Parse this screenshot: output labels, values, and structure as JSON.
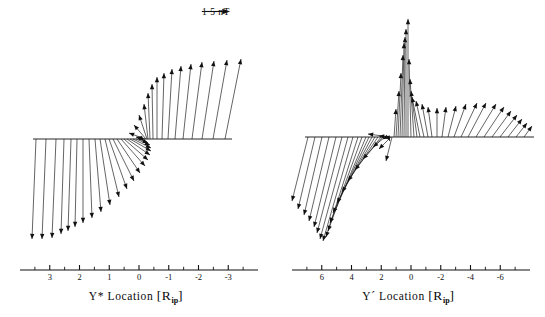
{
  "figure": {
    "background_color": "#ffffff",
    "line_color": "#111111",
    "panels": [
      {
        "id": "left",
        "axis_label_prefix": "Y*",
        "axis_label_main": " Location ",
        "axis_unit_open": "[R",
        "axis_unit_sub": "ip",
        "axis_unit_close": "]",
        "scalebar_label": "1 5 nT",
        "tick_labels": [
          "3",
          "2",
          "1",
          "0",
          "-1",
          "-2",
          "-3"
        ],
        "axis_min": 3,
        "axis_max": -3
      },
      {
        "id": "right",
        "axis_label_prefix": "Y´",
        "axis_label_main": " Location ",
        "axis_unit_open": "[R",
        "axis_unit_sub": "ip",
        "axis_unit_close": "]",
        "scalebar_label": "1 5 nT",
        "tick_labels": [
          "6",
          "4",
          "2",
          "0",
          "-2",
          "-4",
          "-6"
        ],
        "axis_min": 6,
        "axis_max": -6
      }
    ]
  },
  "chart_data": {
    "type": "scatter",
    "title": "",
    "grid": false,
    "legend_position": "top-right",
    "panels": [
      {
        "name": "left",
        "xlabel": "Y* Location [R_ip]",
        "ylabel": "",
        "xlim": [
          3,
          -3
        ],
        "scalebar_value": "1 5 nT",
        "scalebar_pixel_length": 26,
        "baseline_y": 139,
        "baseline_x_start": 33,
        "baseline_x_end": 232,
        "vectors": [
          {
            "x0": 36,
            "dx": -4,
            "dy": 100
          },
          {
            "x0": 46,
            "dx": -4,
            "dy": 100
          },
          {
            "x0": 56,
            "dx": -4,
            "dy": 99
          },
          {
            "x0": 64,
            "dx": -3,
            "dy": 95
          },
          {
            "x0": 71,
            "dx": -3,
            "dy": 92
          },
          {
            "x0": 77,
            "dx": -2,
            "dy": 88
          },
          {
            "x0": 83,
            "dx": 0,
            "dy": 84
          },
          {
            "x0": 89,
            "dx": 3,
            "dy": 79
          },
          {
            "x0": 95,
            "dx": 6,
            "dy": 73
          },
          {
            "x0": 100,
            "dx": 10,
            "dy": 66
          },
          {
            "x0": 105,
            "dx": 14,
            "dy": 58
          },
          {
            "x0": 109,
            "dx": 18,
            "dy": 50
          },
          {
            "x0": 113,
            "dx": 21,
            "dy": 42
          },
          {
            "x0": 117,
            "dx": 23,
            "dy": 34
          },
          {
            "x0": 121,
            "dx": 24,
            "dy": 27
          },
          {
            "x0": 124,
            "dx": 24,
            "dy": 21
          },
          {
            "x0": 127,
            "dx": 23,
            "dy": 16
          },
          {
            "x0": 130,
            "dx": 21,
            "dy": 12
          },
          {
            "x0": 133,
            "dx": 18,
            "dy": 9
          },
          {
            "x0": 136,
            "dx": 14,
            "dy": 6
          },
          {
            "x0": 139,
            "dx": 9,
            "dy": 4
          },
          {
            "x0": 142,
            "dx": 2,
            "dy": 2
          },
          {
            "x0": 144,
            "dx": -8,
            "dy": -2
          },
          {
            "x0": 145,
            "dx": -16,
            "dy": -6
          },
          {
            "x0": 146,
            "dx": -12,
            "dy": -14
          },
          {
            "x0": 147,
            "dx": -8,
            "dy": -24
          },
          {
            "x0": 148,
            "dx": -4,
            "dy": -35
          },
          {
            "x0": 150,
            "dx": -2,
            "dy": -46
          },
          {
            "x0": 153,
            "dx": -1,
            "dy": -55
          },
          {
            "x0": 157,
            "dx": 0,
            "dy": -62
          },
          {
            "x0": 162,
            "dx": 2,
            "dy": -66
          },
          {
            "x0": 168,
            "dx": 4,
            "dy": -70
          },
          {
            "x0": 175,
            "dx": 6,
            "dy": -73
          },
          {
            "x0": 183,
            "dx": 8,
            "dy": -75
          },
          {
            "x0": 192,
            "dx": 10,
            "dy": -77
          },
          {
            "x0": 202,
            "dx": 12,
            "dy": -78
          },
          {
            "x0": 213,
            "dx": 14,
            "dy": -79
          },
          {
            "x0": 225,
            "dx": 16,
            "dy": -80
          }
        ]
      },
      {
        "name": "right",
        "xlabel": "Y´ Location [R_ip]",
        "ylabel": "",
        "xlim": [
          6,
          -6
        ],
        "scalebar_value": "1 5 nT",
        "scalebar_pixel_length": 62,
        "baseline_y": 137,
        "baseline_x_start": 33,
        "baseline_x_end": 262,
        "vectors": [
          {
            "x0": 36,
            "dx": -16,
            "dy": 64
          },
          {
            "x0": 43,
            "dx": -17,
            "dy": 72
          },
          {
            "x0": 50,
            "dx": -18,
            "dy": 78
          },
          {
            "x0": 57,
            "dx": -20,
            "dy": 84
          },
          {
            "x0": 64,
            "dx": -22,
            "dy": 90
          },
          {
            "x0": 70,
            "dx": -25,
            "dy": 96
          },
          {
            "x0": 76,
            "dx": -28,
            "dy": 102
          },
          {
            "x0": 81,
            "dx": -30,
            "dy": 104
          },
          {
            "x0": 86,
            "dx": -32,
            "dy": 100
          },
          {
            "x0": 90,
            "dx": -34,
            "dy": 94
          },
          {
            "x0": 94,
            "dx": -36,
            "dy": 86
          },
          {
            "x0": 97,
            "dx": -36,
            "dy": 76
          },
          {
            "x0": 100,
            "dx": -35,
            "dy": 66
          },
          {
            "x0": 103,
            "dx": -33,
            "dy": 55
          },
          {
            "x0": 106,
            "dx": -30,
            "dy": 44
          },
          {
            "x0": 109,
            "dx": -26,
            "dy": 33
          },
          {
            "x0": 111,
            "dx": -20,
            "dy": 22
          },
          {
            "x0": 113,
            "dx": -12,
            "dy": 10
          },
          {
            "x0": 115,
            "dx": -4,
            "dy": 2
          },
          {
            "x0": 116,
            "dx": 2,
            "dy": 4
          },
          {
            "x0": 117,
            "dx": -10,
            "dy": -1
          },
          {
            "x0": 118,
            "dx": -22,
            "dy": -3
          },
          {
            "x0": 119,
            "dx": -12,
            "dy": 12
          },
          {
            "x0": 120,
            "dx": -6,
            "dy": 24
          },
          {
            "x0": 122,
            "dx": 2,
            "dy": -28
          },
          {
            "x0": 124,
            "dx": 3,
            "dy": -46
          },
          {
            "x0": 126,
            "dx": 3,
            "dy": -64
          },
          {
            "x0": 128,
            "dx": 3,
            "dy": -82
          },
          {
            "x0": 130,
            "dx": 2,
            "dy": -94
          },
          {
            "x0": 132,
            "dx": 1,
            "dy": -100
          },
          {
            "x0": 134,
            "dx": 0,
            "dy": -108
          },
          {
            "x0": 136,
            "dx": 0,
            "dy": -118
          },
          {
            "x0": 139,
            "dx": -2,
            "dy": -78
          },
          {
            "x0": 142,
            "dx": -4,
            "dy": -58
          },
          {
            "x0": 145,
            "dx": -6,
            "dy": -46
          },
          {
            "x0": 148,
            "dx": -8,
            "dy": -40
          },
          {
            "x0": 152,
            "dx": -8,
            "dy": -36
          },
          {
            "x0": 156,
            "dx": -6,
            "dy": -33
          },
          {
            "x0": 160,
            "dx": -4,
            "dy": -30
          },
          {
            "x0": 165,
            "dx": 0,
            "dy": -29
          },
          {
            "x0": 170,
            "dx": 4,
            "dy": -30
          },
          {
            "x0": 176,
            "dx": 8,
            "dy": -31
          },
          {
            "x0": 182,
            "dx": 12,
            "dy": -33
          },
          {
            "x0": 189,
            "dx": 16,
            "dy": -34
          },
          {
            "x0": 196,
            "dx": 18,
            "dy": -34
          },
          {
            "x0": 204,
            "dx": 20,
            "dy": -33
          },
          {
            "x0": 212,
            "dx": 20,
            "dy": -30
          },
          {
            "x0": 220,
            "dx": 19,
            "dy": -26
          },
          {
            "x0": 228,
            "dx": 17,
            "dy": -22
          },
          {
            "x0": 236,
            "dx": 14,
            "dy": -18
          },
          {
            "x0": 244,
            "dx": 11,
            "dy": -14
          },
          {
            "x0": 252,
            "dx": 8,
            "dy": -11
          }
        ]
      }
    ]
  }
}
